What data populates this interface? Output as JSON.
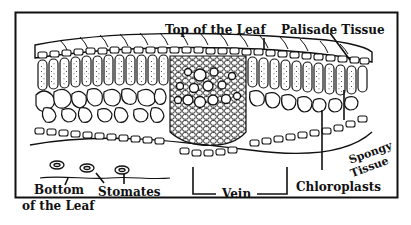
{
  "diagram": {
    "labels": {
      "top_of_leaf": "Top of the Leaf",
      "palisade_tissue": "Palisade Tissue",
      "spongy_line1": "Spongy",
      "spongy_line2": "Tissue",
      "bottom_line1": "Bottom",
      "bottom_line2": "of the Leaf",
      "stomates": "Stomates",
      "vein": "Vein",
      "chloroplasts": "Chloroplasts"
    },
    "colors": {
      "ink": "#111111",
      "paper": "#ffffff"
    }
  }
}
